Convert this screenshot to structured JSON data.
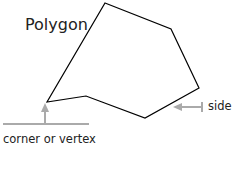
{
  "diagram": {
    "title": "Polygon",
    "labels": {
      "vertex": "corner or vertex",
      "side": "side"
    },
    "polygon_points": [
      [
        105,
        3
      ],
      [
        171,
        29
      ],
      [
        199,
        88
      ],
      [
        145,
        118
      ],
      [
        86,
        96
      ],
      [
        47,
        102
      ]
    ],
    "colors": {
      "outline": "#000000",
      "arrow": "#aaaaaa",
      "text": "#222222"
    }
  }
}
